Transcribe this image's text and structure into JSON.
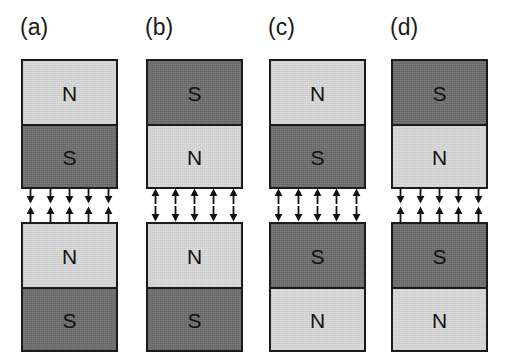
{
  "figure": {
    "background_color": "#ffffff",
    "north_color": "#dadada",
    "south_color": "#6e6e6e",
    "border_color": "#1c1c1c",
    "arrow_color": "#111111",
    "arrows_per_row": 5,
    "panels": [
      {
        "id": "a",
        "label": "(a)",
        "top_magnet": {
          "upper_pole": "N",
          "lower_pole": "S"
        },
        "bottom_magnet": {
          "upper_pole": "N",
          "lower_pole": "S"
        },
        "upper_arrows_direction": "down",
        "lower_arrows_direction": "up"
      },
      {
        "id": "b",
        "label": "(b)",
        "top_magnet": {
          "upper_pole": "S",
          "lower_pole": "N"
        },
        "bottom_magnet": {
          "upper_pole": "N",
          "lower_pole": "S"
        },
        "upper_arrows_direction": "up",
        "lower_arrows_direction": "down"
      },
      {
        "id": "c",
        "label": "(c)",
        "top_magnet": {
          "upper_pole": "N",
          "lower_pole": "S"
        },
        "bottom_magnet": {
          "upper_pole": "S",
          "lower_pole": "N"
        },
        "upper_arrows_direction": "up",
        "lower_arrows_direction": "down"
      },
      {
        "id": "d",
        "label": "(d)",
        "top_magnet": {
          "upper_pole": "S",
          "lower_pole": "N"
        },
        "bottom_magnet": {
          "upper_pole": "S",
          "lower_pole": "N"
        },
        "upper_arrows_direction": "down",
        "lower_arrows_direction": "up"
      }
    ]
  }
}
